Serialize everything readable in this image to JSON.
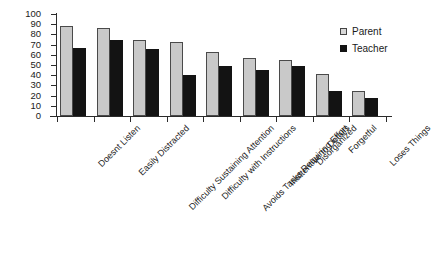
{
  "chart_data": {
    "type": "bar",
    "title": "",
    "subtitle": "",
    "xlabel": "",
    "ylabel": "",
    "ylim": [
      0,
      100
    ],
    "ytick_step": 10,
    "yticks": [
      100,
      90,
      80,
      70,
      60,
      50,
      40,
      30,
      20,
      10,
      0
    ],
    "grid": false,
    "legend_position": "top-right",
    "categories": [
      "Doesnt Listen",
      "Easily Distracted",
      "Difficulty Sustaining Attention",
      "Difficulty with Instructions",
      "Avoids Tasks Requiring Effort",
      "Inattentive to Details",
      "Disorganized",
      "Forgetful",
      "Loses Things"
    ],
    "series": [
      {
        "name": "Parent",
        "color": "#c9c9c9",
        "values": [
          88,
          86,
          75,
          73,
          63,
          57,
          55,
          41,
          25
        ]
      },
      {
        "name": "Teacher",
        "color": "#131313",
        "values": [
          67,
          75,
          66,
          40,
          49,
          45,
          49,
          25,
          18
        ]
      }
    ]
  },
  "legend": {
    "entries": [
      {
        "label": "Parent",
        "swatch": "parent-swatch"
      },
      {
        "label": "Teacher",
        "swatch": "teacher-swatch"
      }
    ]
  }
}
